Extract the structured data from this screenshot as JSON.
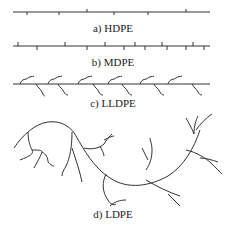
{
  "figure": {
    "panels": [
      {
        "id": "a",
        "label": "a) HDPE",
        "description": "linear chain with few short branches"
      },
      {
        "id": "b",
        "label": "b) MDPE",
        "description": "linear chain with more short branches"
      },
      {
        "id": "c",
        "label": "c) LLDPE",
        "description": "linear chain with many short curly branches"
      },
      {
        "id": "d",
        "label": "d) LDPE",
        "description": "highly branched chain with long branches"
      }
    ]
  }
}
